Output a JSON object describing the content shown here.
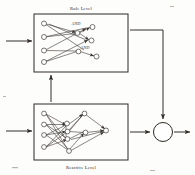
{
  "figure": {
    "caption_top": "Rule Level",
    "caption_bottom": "Reactive Level",
    "and_label_1": "AND",
    "and_label_2": "AND",
    "colors": {
      "background": "#fdfdfc",
      "ink": "#2f2b27",
      "node_fill": "#ffffff",
      "edge": "#3a3632"
    }
  },
  "diagram_data": {
    "type": "block-diagram",
    "title": "Two-level hybrid control architecture",
    "blocks": [
      {
        "id": "rule-level",
        "label": "Rule Level",
        "label_position": "above",
        "x": 34,
        "y": 14,
        "width": 94,
        "height": 58,
        "content": "symbolic rule network with AND conjunction nodes"
      },
      {
        "id": "reactive-level",
        "label": "Reactive Level",
        "label_position": "below",
        "x": 34,
        "y": 104,
        "width": 94,
        "height": 56,
        "content": "densely connected reactive neural network"
      }
    ],
    "summing_junction": {
      "id": "output-junction",
      "shape": "circle",
      "cx": 163,
      "cy": 132,
      "r": 9.5
    },
    "signals": [
      {
        "id": "input-rule",
        "from": "external",
        "to": "rule-level",
        "direction": "right",
        "label": ""
      },
      {
        "id": "input-reactive",
        "from": "external",
        "to": "reactive-level",
        "direction": "right",
        "label": ""
      },
      {
        "id": "reactive-to-rule",
        "from": "reactive-level",
        "to": "rule-level",
        "direction": "up",
        "label": ""
      },
      {
        "id": "rule-to-junction",
        "from": "rule-level",
        "to": "output-junction",
        "direction": "right-then-down",
        "label": ""
      },
      {
        "id": "reactive-to-junction",
        "from": "reactive-level",
        "to": "output-junction",
        "direction": "right",
        "label": ""
      },
      {
        "id": "junction-output",
        "from": "output-junction",
        "to": "external",
        "direction": "right",
        "label": ""
      }
    ],
    "rule_network": {
      "input_nodes": 4,
      "and_nodes": 2,
      "output_nodes": 3,
      "and_labels": [
        "AND",
        "AND"
      ]
    },
    "reactive_network": {
      "input_nodes": 4,
      "hidden_nodes": 4,
      "output_nodes": 1,
      "fully_connected": true
    }
  }
}
